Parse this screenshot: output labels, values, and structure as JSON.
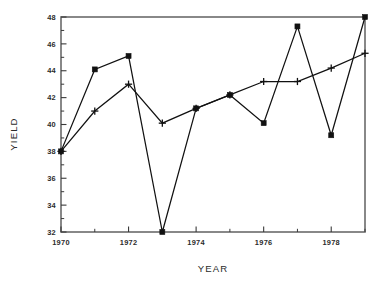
{
  "chart_data": {
    "type": "line",
    "title": "",
    "subtitle": "",
    "xlabel": "YEAR",
    "ylabel": "YIELD",
    "xlim": [
      1970,
      1979
    ],
    "ylim": [
      32,
      48
    ],
    "grid": false,
    "legend": "none",
    "x": [
      1970,
      1971,
      1972,
      1973,
      1974,
      1975,
      1976,
      1977,
      1978,
      1979
    ],
    "xtick_major_values": [
      1970,
      1972,
      1974,
      1976,
      1978
    ],
    "xtick_major_labels": [
      "1970",
      "1972",
      "1974",
      "1976",
      "1978"
    ],
    "xtick_minor_values": [
      1971,
      1973,
      1975,
      1977,
      1979
    ],
    "ytick_major_values": [
      32,
      34,
      36,
      38,
      40,
      42,
      44,
      46,
      48
    ],
    "ytick_major_labels": [
      "32",
      "34",
      "36",
      "38",
      "40",
      "42",
      "44",
      "46",
      "48"
    ],
    "ytick_minor_values": [
      33,
      35,
      37,
      39,
      41,
      43,
      45,
      47
    ],
    "series": [
      {
        "name": "series-square",
        "marker": "square",
        "values": [
          38.0,
          44.1,
          45.1,
          32.0,
          41.2,
          42.2,
          40.1,
          47.3,
          39.2,
          48.0
        ]
      },
      {
        "name": "series-plus",
        "marker": "plus",
        "values": [
          38.0,
          41.0,
          43.0,
          40.1,
          41.2,
          42.2,
          43.2,
          43.2,
          44.2,
          45.3
        ]
      }
    ],
    "colors": {
      "line": "#111111",
      "marker": "#111111",
      "frame": "#6b6b6b",
      "text": "#2b2b2b",
      "background": "#ffffff"
    }
  }
}
